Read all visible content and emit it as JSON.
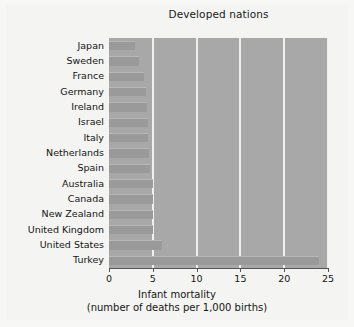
{
  "chart_data": {
    "type": "bar",
    "orientation": "horizontal",
    "title": "Developed nations",
    "xlabel_line1": "Infant mortality",
    "xlabel_line2": "(number of deaths per 1,000 births)",
    "ylabel": "",
    "categories": [
      "Japan",
      "Sweden",
      "France",
      "Germany",
      "Ireland",
      "Israel",
      "Italy",
      "Netherlands",
      "Spain",
      "Australia",
      "Canada",
      "New Zealand",
      "United Kingdom",
      "United States",
      "Turkey"
    ],
    "values": [
      3.0,
      3.4,
      4.0,
      4.2,
      4.3,
      4.4,
      4.5,
      4.6,
      4.7,
      5.0,
      5.0,
      5.0,
      5.0,
      6.1,
      24.0
    ],
    "xlim": [
      0,
      25
    ],
    "xticks": [
      0,
      5,
      10,
      15,
      20,
      25
    ],
    "xtick_labels": [
      "0",
      "5",
      "10",
      "15",
      "20",
      "25"
    ],
    "grid": "vertical",
    "legend": "none",
    "plot_background": "#a8a8a8",
    "bar_color": "#9a9a9a",
    "gridline_color": "#f0f0ee",
    "figure_background": "#f4f4f2"
  }
}
